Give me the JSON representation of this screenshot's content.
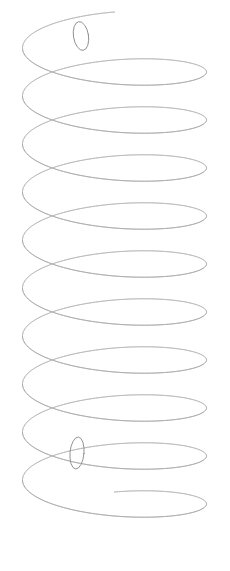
{
  "figure": {
    "kind": "line-drawing",
    "canvas": {
      "width": 230,
      "height": 571
    },
    "background_color": "#ffffff",
    "stroke_color": "#8d8d8d",
    "stroke_color_light": "#a6a6a6",
    "stroke_width": 0.85,
    "texture": "scanned pencil line, lightly dotted anti-aliased edges"
  },
  "geometry": {
    "axis": "vertical",
    "center_x": 114.5,
    "radius_x": 92,
    "radius_y": 24,
    "top_y": 36,
    "bottom_y": 516,
    "turns": 10,
    "pitch_y": 48,
    "left_silhouette_x": 22,
    "right_silhouette_x": 207,
    "samples_per_turn": 150,
    "phase_offset_deg": 180
  },
  "end_loops": [
    {
      "name": "top-end-loop",
      "cx": 81,
      "cy": 36,
      "rx": 7.5,
      "ry": 14.5,
      "rotate_deg": -9,
      "label": "upper wire terminus curled toward viewer"
    },
    {
      "name": "bottom-end-loop",
      "cx": 77,
      "cy": 453,
      "rx": 7,
      "ry": 16,
      "rotate_deg": 5,
      "label": "lower wire terminus curled toward viewer"
    }
  ],
  "annotations": {
    "text_present": "none",
    "labels": [],
    "axes": "none",
    "legend": "none"
  }
}
